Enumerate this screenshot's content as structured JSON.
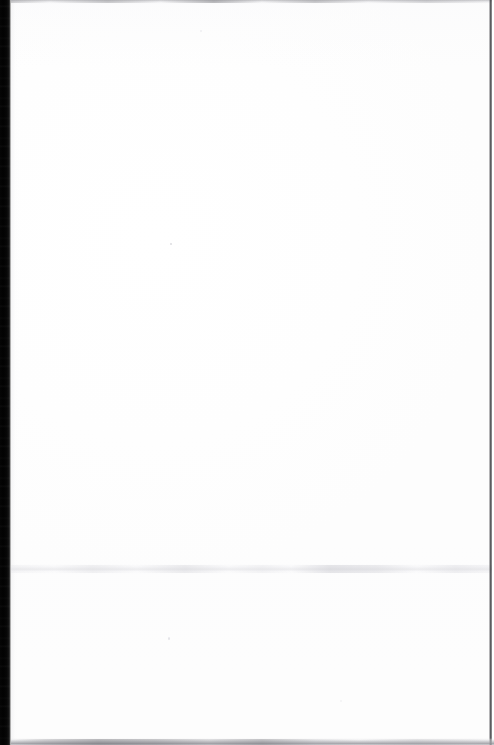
{
  "document": {
    "kind": "scanned-page",
    "title": "",
    "page_text": "",
    "content_summary": "blank page",
    "visible_text_blocks": [],
    "page_number_label": "",
    "header_text": "",
    "footer_text": ""
  },
  "scan": {
    "width_px": 494,
    "height_px": 745,
    "paper_color": "#ffffff",
    "background_color": "#ffffff"
  },
  "artifacts": {
    "gutter": {
      "label": "left-gutter-shadow",
      "color": "#040404",
      "left_px": 0,
      "width_px": 11
    },
    "top_edge": {
      "label": "top-edge-line",
      "color": "#b0b0b4",
      "top_px": 0,
      "height_px": 4
    },
    "seam": {
      "label": "horizontal-seam-band",
      "color": "#e9e9ec",
      "top_px": 564,
      "height_px": 10
    },
    "right_edge": {
      "label": "right-edge-line",
      "color": "#2e2e32",
      "left_px": 489,
      "width_px": 3
    },
    "bottom_edge": {
      "label": "bottom-edge-band",
      "color": "#96969c",
      "top_px": 738,
      "height_px": 7
    },
    "specks": [
      {
        "label": "speck-upper-center",
        "x_px": 170,
        "y_px": 243,
        "color": "#d6d6db"
      },
      {
        "label": "speck-lower-center",
        "x_px": 168,
        "y_px": 637,
        "color": "#dddde2"
      },
      {
        "label": "speck-top",
        "x_px": 200,
        "y_px": 30,
        "color": "#eaeaee"
      },
      {
        "label": "speck-bottom-right",
        "x_px": 340,
        "y_px": 700,
        "color": "#eeeef1"
      }
    ]
  }
}
